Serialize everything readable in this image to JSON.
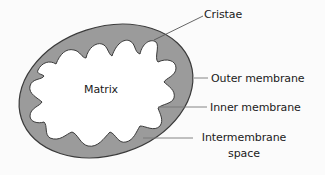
{
  "diagram": {
    "title": "",
    "colors": {
      "background": "#fbfbfb",
      "outer_membrane_fill": "#9b9b9b",
      "outline": "#3a3a3a",
      "matrix_fill": "#ffffff",
      "leader_line": "#555555",
      "text": "#1a1a1a"
    },
    "labels": {
      "matrix": "Matrix",
      "cristae": "Cristae",
      "outer_membrane": "Outer membrane",
      "inner_membrane": "Inner membrane",
      "intermembrane_line1": "Intermembrane",
      "intermembrane_line2": "space"
    }
  }
}
